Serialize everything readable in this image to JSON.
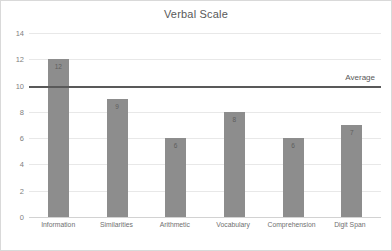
{
  "chart_data": {
    "type": "bar",
    "title": "Verbal Scale",
    "xlabel": "",
    "ylabel": "",
    "categories": [
      "Information",
      "Similarities",
      "Arithmetic",
      "Vocabulary",
      "Comprehension",
      "Digit Span"
    ],
    "values": [
      12,
      9,
      6,
      8,
      6,
      7
    ],
    "data_labels": [
      "12",
      "9",
      "6",
      "8",
      "6",
      "7"
    ],
    "ylim": [
      0,
      14
    ],
    "yticks": [
      0,
      2,
      4,
      6,
      8,
      10,
      12,
      14
    ],
    "ytick_labels": [
      "0",
      "2",
      "4",
      "6",
      "8",
      "10",
      "12",
      "14"
    ],
    "grid": true,
    "legend": false,
    "annotations": [
      {
        "name": "average-line",
        "label": "Average",
        "value": 10,
        "orientation": "horizontal",
        "label_position": "right"
      }
    ],
    "colors": {
      "bar": "#8d8d8d",
      "average_line": "#595959",
      "gridline": "#e8e8e8",
      "title_text": "#595959",
      "tick_text": "#808080",
      "background": "#ffffff",
      "border": "#d9d9d9"
    }
  }
}
